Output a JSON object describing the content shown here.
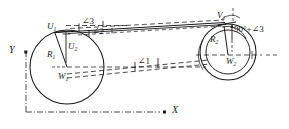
{
  "figure": {
    "type": "geometry-diagram",
    "stroke_color": "#1a1a1a",
    "background": "#ffffff"
  },
  "axes": {
    "x_label": "X",
    "y_label": "Y"
  },
  "left_circle": {
    "center_label": "W",
    "center_sub": "1",
    "radius_label": "R",
    "radius_sub": "1",
    "point_top_label": "U",
    "point_top_sub": "1",
    "point_inner_label": "U",
    "point_inner_sub": "2"
  },
  "right_circle": {
    "center_label": "W",
    "center_sub": "2",
    "radius_label": "R",
    "radius_sub": "2",
    "point_top_label": "V",
    "point_top_sub": "1",
    "point_top2_label": "V",
    "point_top2_sub": "2"
  },
  "angles": {
    "angle1": "∠1",
    "angle2": "∠2",
    "angle3": "∠3",
    "angle_right": "90°+∠3"
  }
}
